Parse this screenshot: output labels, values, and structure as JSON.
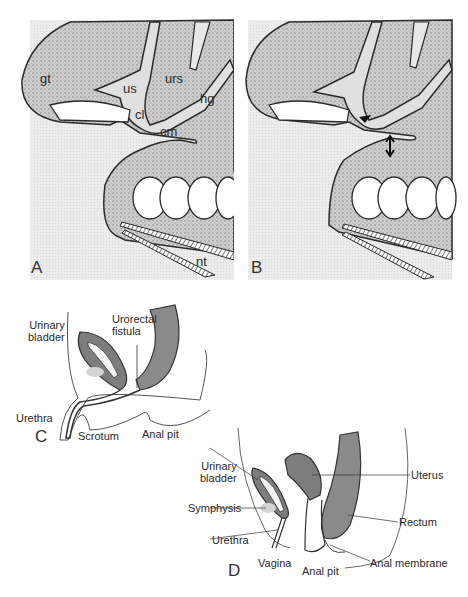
{
  "figure": {
    "panels": [
      {
        "id": "A",
        "label": "A",
        "annotations": [
          "gt",
          "us",
          "urs",
          "hg",
          "cl",
          "cm",
          "nt"
        ]
      },
      {
        "id": "B",
        "label": "B",
        "annotations": []
      },
      {
        "id": "C",
        "label": "C",
        "annotations": [
          "Urinary\nbladder",
          "Urorectal\nfistula",
          "Urethra",
          "Scrotum",
          "Anal pit"
        ]
      },
      {
        "id": "D",
        "label": "D",
        "annotations": [
          "Urinary\nbladder",
          "Symphysis",
          "Urethra",
          "Vagina",
          "Anal pit",
          "Uterus",
          "Rectum",
          "Anal membrane"
        ]
      }
    ],
    "colors": {
      "stipple": "#b8b8b8",
      "background_tint": "#e6e6e6",
      "outline": "#2b2b2b",
      "rectum_fill": "#8a8a8a",
      "bladder_fill": "#7d7d7d"
    }
  }
}
